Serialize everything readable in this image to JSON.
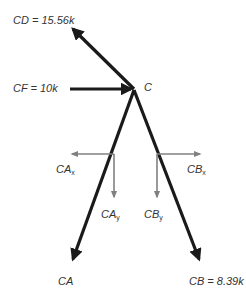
{
  "diagram": {
    "type": "free-body-diagram",
    "joint": {
      "name": "C"
    },
    "members": [
      {
        "id": "CD",
        "label": "CD",
        "value": "15.56k",
        "text": "CD = 15.56k"
      },
      {
        "id": "CF",
        "label": "CF",
        "value": "10k",
        "text": "CF = 10k"
      },
      {
        "id": "CA",
        "label": "CA",
        "value": "",
        "text": "CA"
      },
      {
        "id": "CB",
        "label": "CB",
        "value": "8.39k",
        "text": "CB = 8.39k"
      }
    ],
    "components": [
      {
        "id": "CAx",
        "base": "CA",
        "sub": "x"
      },
      {
        "id": "CAy",
        "base": "CA",
        "sub": "y"
      },
      {
        "id": "CBx",
        "base": "CB",
        "sub": "x"
      },
      {
        "id": "CBy",
        "base": "CB",
        "sub": "y"
      }
    ],
    "colors": {
      "member": "#1a1a1a",
      "component": "#808080",
      "label": "#333333",
      "background": "#ffffff"
    }
  }
}
